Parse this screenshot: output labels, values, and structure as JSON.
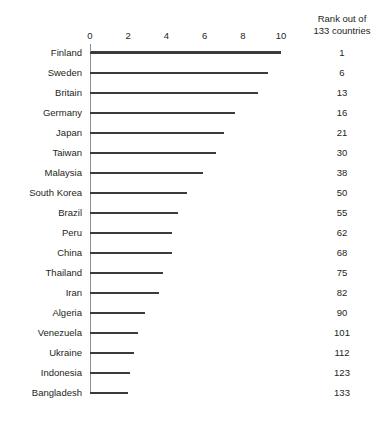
{
  "chart_data": {
    "type": "bar",
    "orientation": "horizontal",
    "title": "",
    "subtitle": "",
    "xlabel": "",
    "ylabel": "",
    "xlim": [
      0,
      10
    ],
    "xticks": [
      0,
      2,
      4,
      6,
      8,
      10
    ],
    "xtick_labels": [
      "0",
      "2",
      "4",
      "6",
      "8",
      "10"
    ],
    "grid": false,
    "legend": null,
    "categories": [
      "Finland",
      "Sweden",
      "Britain",
      "Germany",
      "Japan",
      "Taiwan",
      "Malaysia",
      "South Korea",
      "Brazil",
      "Peru",
      "China",
      "Thailand",
      "Iran",
      "Algeria",
      "Venezuela",
      "Ukraine",
      "Indonesia",
      "Bangladesh"
    ],
    "values": [
      10.0,
      9.3,
      8.8,
      7.6,
      7.0,
      6.6,
      5.9,
      5.1,
      4.6,
      4.3,
      4.3,
      3.8,
      3.6,
      2.9,
      2.5,
      2.3,
      2.1,
      2.0
    ],
    "annotation_column": {
      "header_lines": [
        "Rank out of",
        "133 countries"
      ],
      "values": [
        "1",
        "6",
        "13",
        "16",
        "21",
        "30",
        "38",
        "50",
        "55",
        "62",
        "68",
        "75",
        "82",
        "90",
        "101",
        "112",
        "123",
        "133"
      ]
    },
    "colors": {
      "bar": "#3b3b3b",
      "axis": "#3b3b3b",
      "baseline": "#8f8f8f",
      "text": "#231f20",
      "background": "#ffffff"
    }
  }
}
